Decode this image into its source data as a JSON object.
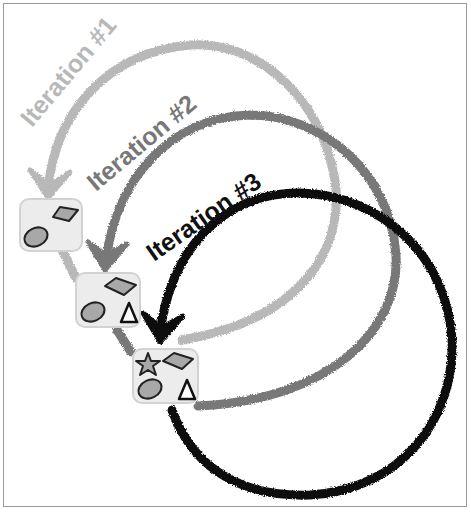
{
  "diagram": {
    "iterations": [
      {
        "label": "Iteration #1",
        "color": "#b8b8b8",
        "shapes": [
          "diamond",
          "ellipse"
        ]
      },
      {
        "label": "Iteration #2",
        "color": "#787878",
        "shapes": [
          "diamond",
          "ellipse",
          "triangle"
        ]
      },
      {
        "label": "Iteration #3",
        "color": "#111111",
        "shapes": [
          "star",
          "diamond",
          "ellipse",
          "triangle"
        ]
      }
    ],
    "box_fill": "#ececec",
    "box_border": "#d2d2d2",
    "shape_fill": "#a8a8a8"
  }
}
